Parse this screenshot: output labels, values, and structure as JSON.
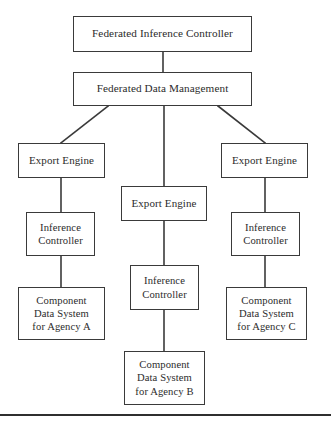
{
  "diagram": {
    "stroke_color": "#3a3a3a",
    "text_color": "#2b2b2b",
    "background_color": "#ffffff",
    "rule_color": "#2f2f2f",
    "nodes": {
      "federated_inference_controller": "Federated Inference Controller",
      "federated_data_management": "Federated Data Management",
      "export_engine_left": "Export Engine",
      "export_engine_middle": "Export Engine",
      "export_engine_right": "Export Engine",
      "inference_controller_left": "Inference\nController",
      "inference_controller_middle": "Inference\nController",
      "inference_controller_right": "Inference\nController",
      "component_data_system_a": "Component\nData System\nfor Agency A",
      "component_data_system_b": "Component\nData System\nfor Agency B",
      "component_data_system_c": "Component\nData System\nfor Agency C"
    }
  }
}
